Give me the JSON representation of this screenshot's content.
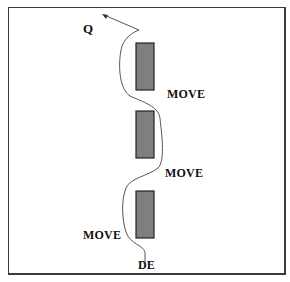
{
  "diagram": {
    "title": "",
    "labels": {
      "start": "Q",
      "move_top": "MOVE",
      "move_middle": "MOVE",
      "move_bottom": "MOVE",
      "end": "DE"
    },
    "obstacles": [
      {
        "name": "obstacle-top",
        "x": 136,
        "y": 43,
        "w": 18,
        "h": 47
      },
      {
        "name": "obstacle-middle",
        "x": 136,
        "y": 111,
        "w": 18,
        "h": 47
      },
      {
        "name": "obstacle-bottom",
        "x": 136,
        "y": 191,
        "w": 18,
        "h": 47
      }
    ],
    "colors": {
      "obstacle_fill": "#7f7f7f",
      "obstacle_stroke": "#222222",
      "path_stroke": "#555555",
      "frame": "#3a3a3a",
      "text": "#111111"
    }
  }
}
